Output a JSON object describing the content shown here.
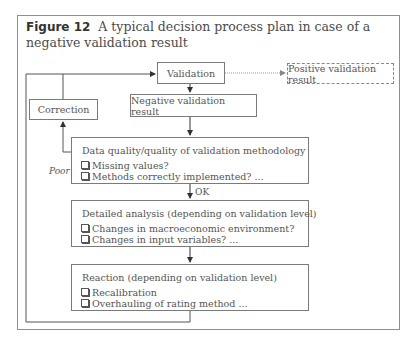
{
  "caption": {
    "figure_label": "Figure 12",
    "text": "A typical decision process plan in case of a negative validation result"
  },
  "nodes": {
    "validation": "Validation",
    "positive": "Positive validation result",
    "negative": "Negative validation result",
    "correction": "Correction",
    "data_quality": {
      "title": "Data quality/quality of validation methodology",
      "items": [
        "Missing values?",
        "Methods correctly implemented? ..."
      ]
    },
    "detailed": {
      "title": "Detailed analysis (depending on validation level)",
      "items": [
        "Changes in macroeconomic environment?",
        "Changes in input variables? ..."
      ]
    },
    "reaction": {
      "title": "Reaction (depending on validation level)",
      "items": [
        "Recalibration",
        "Overhauling of rating method ..."
      ]
    }
  },
  "edge_labels": {
    "poor": "Poor",
    "ok": "OK"
  }
}
